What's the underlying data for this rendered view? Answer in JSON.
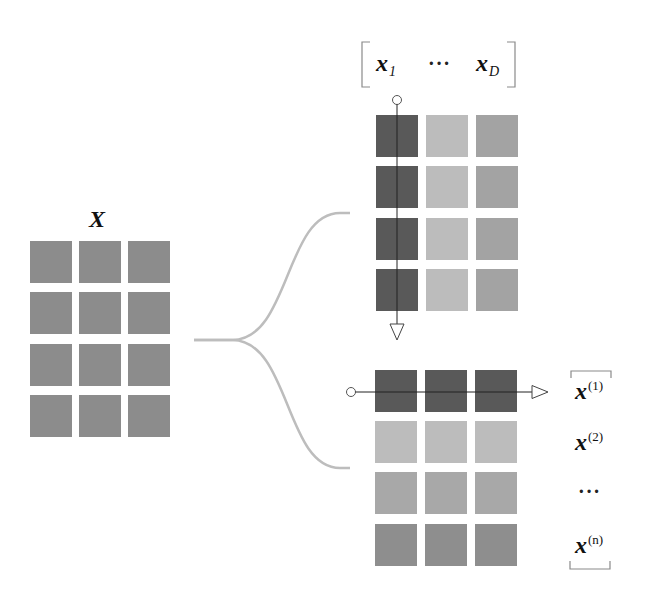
{
  "matrix_label": "X",
  "left_grid": {
    "rows": 4,
    "cols": 3,
    "color": "#8c8c8c"
  },
  "column_view": {
    "bracket_labels": [
      {
        "base": "x",
        "sub": "1"
      },
      {
        "ellipsis": "···"
      },
      {
        "base": "x",
        "sub": "D"
      }
    ],
    "column_colors": [
      "#595959",
      "#bcbcbc",
      "#a3a3a3"
    ]
  },
  "row_view": {
    "row_colors": [
      "#595959",
      "#bcbcbc",
      "#a8a8a8",
      "#8e8e8e"
    ],
    "labels": [
      {
        "base": "x",
        "sup": "(1)"
      },
      {
        "base": "x",
        "sup": "(2)"
      },
      {
        "ellipsis": "···"
      },
      {
        "base": "x",
        "sup": "(n)"
      }
    ]
  },
  "colors": {
    "line": "#333333",
    "brace": "#bdbdbd",
    "bracket": "#8a8a8a"
  }
}
